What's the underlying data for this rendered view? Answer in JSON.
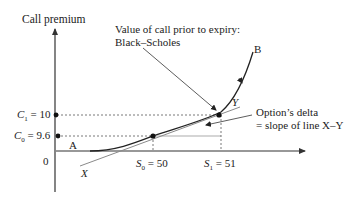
{
  "diagram": {
    "y_axis_label": "Call premium",
    "origin_label": "0",
    "annotations": {
      "bs_line1": "Value of call prior to expiry:",
      "bs_line2": "Black–Scholes",
      "delta_line1": "Option’s delta",
      "delta_line2": "= slope of line X–Y"
    },
    "y_ticks": [
      {
        "label": "C1 = 10",
        "sym": "C",
        "sub": "1",
        "val": "= 10"
      },
      {
        "label": "C0 = 9.6",
        "sym": "C",
        "sub": "0",
        "val": "= 9.6"
      }
    ],
    "x_ticks": [
      {
        "label": "S0 = 50",
        "sym": "S",
        "sub": "0",
        "val": "= 50"
      },
      {
        "label": "S1 = 51",
        "sym": "S",
        "sub": "1",
        "val": "= 51"
      }
    ],
    "points": {
      "A": "A",
      "B": "B",
      "X": "X",
      "Y": "Y"
    },
    "colors": {
      "curve": "#222222",
      "tangent": "#8a8a8a",
      "axis": "#333333",
      "dotted": "#555555"
    }
  }
}
